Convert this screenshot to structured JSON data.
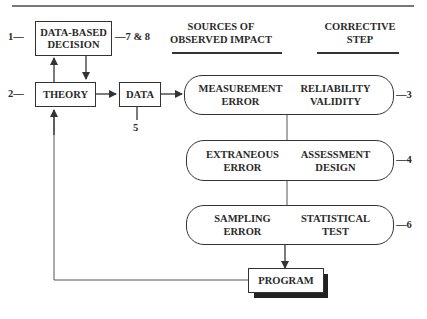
{
  "headers": {
    "sources": "SOURCES OF OBSERVED IMPACT",
    "sources_line1": "SOURCES OF",
    "sources_line2": "OBSERVED IMPACT",
    "corrective_line1": "CORRECTIVE",
    "corrective_line2": "STEP"
  },
  "boxes": {
    "decision_line1": "DATA-BASED",
    "decision_line2": "DECISION",
    "theory": "THEORY",
    "data": "DATA",
    "program": "PROGRAM"
  },
  "pills": [
    {
      "left_line1": "MEASUREMENT",
      "left_line2": "ERROR",
      "right_line1": "RELIABILITY",
      "right_line2": "VALIDITY",
      "label": "—3"
    },
    {
      "left_line1": "EXTRANEOUS",
      "left_line2": "ERROR",
      "right_line1": "ASSESSMENT",
      "right_line2": "DESIGN",
      "label": "—4"
    },
    {
      "left_line1": "SAMPLING",
      "left_line2": "ERROR",
      "right_line1": "STATISTICAL",
      "right_line2": "TEST",
      "label": "—6"
    }
  ],
  "labels": {
    "decision_left": "1—",
    "decision_right": "—7 & 8",
    "theory_left": "2—",
    "data_below": "5"
  }
}
